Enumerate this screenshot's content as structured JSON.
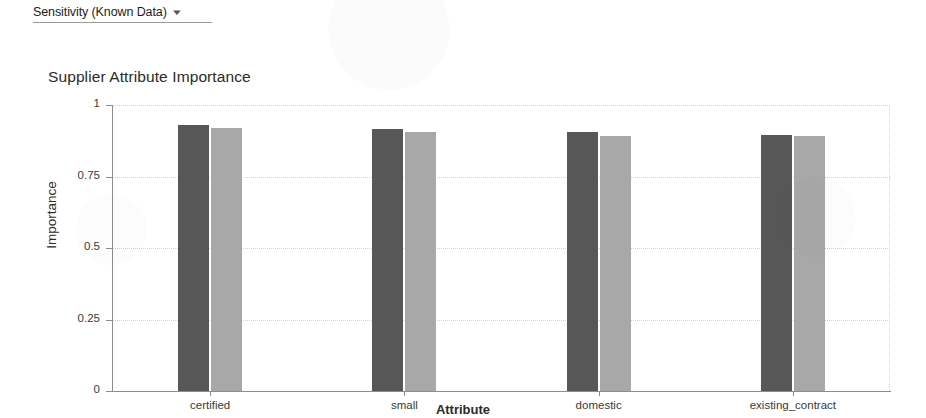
{
  "toolbar": {
    "sensitivity_selector_label": "Sensitivity (Known Data)",
    "caret_icon": "chevron-down-icon"
  },
  "chart_data": {
    "type": "bar",
    "title": "Supplier Attribute Importance",
    "xlabel": "Attribute",
    "ylabel": "Importance",
    "categories": [
      "certified",
      "small",
      "domestic",
      "existing_contract"
    ],
    "ylim": [
      0,
      1
    ],
    "yticks": [
      "0",
      "0.25",
      "0.5",
      "0.75",
      "1"
    ],
    "ytick_values": [
      0,
      0.25,
      0.5,
      0.75,
      1
    ],
    "grid": true,
    "legend": "none",
    "series": [
      {
        "name": "series-dark",
        "color": "#575757",
        "values": [
          0.93,
          0.915,
          0.905,
          0.895
        ]
      },
      {
        "name": "series-light",
        "color": "#a8a8a8",
        "values": [
          0.92,
          0.905,
          0.89,
          0.89
        ]
      }
    ]
  }
}
